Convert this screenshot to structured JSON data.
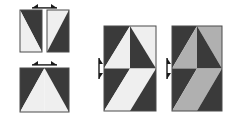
{
  "figure": {
    "background_color": "#ffffff",
    "width": 226,
    "height": 118,
    "palette": {
      "dark": "#3a3a3a",
      "light": "#efefef",
      "gray": "#b0b0b0",
      "outline": "#4a4a4a",
      "arrow": "#1a1a1a"
    },
    "groups": [
      {
        "name": "top-left-pair",
        "label": "Two diagonally split rectangles",
        "arrow": "horizontal-double-arrow",
        "arrow_position": "above",
        "tiles": [
          {
            "name": "tile-diagonal-a",
            "pattern": "diagonal-split",
            "x": 20,
            "y": 10,
            "w": 22,
            "h": 42,
            "regions": [
              {
                "name": "upper-right-triangle",
                "color": "dark"
              },
              {
                "name": "lower-left-triangle",
                "color": "light"
              }
            ]
          },
          {
            "name": "tile-diagonal-b",
            "pattern": "diagonal-split",
            "x": 47,
            "y": 10,
            "w": 22,
            "h": 42,
            "regions": [
              {
                "name": "upper-left-triangle",
                "color": "light"
              },
              {
                "name": "lower-right-triangle",
                "color": "dark"
              }
            ]
          }
        ]
      },
      {
        "name": "bottom-left-square",
        "label": "Four triangle mountain square",
        "arrow": "horizontal-double-arrow",
        "arrow_position": "above",
        "tiles": [
          {
            "name": "tile-mountain",
            "pattern": "four-triangle",
            "x": 20,
            "y": 68,
            "w": 49,
            "h": 44,
            "regions": [
              {
                "name": "left-outer-triangle",
                "color": "dark"
              },
              {
                "name": "left-inner-triangle",
                "color": "light"
              },
              {
                "name": "right-inner-triangle",
                "color": "light"
              },
              {
                "name": "right-outer-triangle",
                "color": "dark"
              }
            ]
          }
        ]
      },
      {
        "name": "center-pinwheel",
        "label": "Eight triangle pinwheel, light variant",
        "arrow": "vertical-double-arrow",
        "arrow_position": "left",
        "tiles": [
          {
            "name": "tile-pinwheel-light",
            "pattern": "eight-triangle-pinwheel",
            "x": 104,
            "y": 26,
            "w": 52,
            "h": 85,
            "variant": "light",
            "regions": [
              {
                "name": "q1-outer",
                "color": "dark"
              },
              {
                "name": "q1-inner",
                "color": "light"
              },
              {
                "name": "q2-outer",
                "color": "light"
              },
              {
                "name": "q2-inner",
                "color": "dark"
              },
              {
                "name": "q3-outer",
                "color": "dark"
              },
              {
                "name": "q3-inner",
                "color": "light"
              },
              {
                "name": "q4-outer",
                "color": "light"
              },
              {
                "name": "q4-inner",
                "color": "dark"
              }
            ]
          }
        ]
      },
      {
        "name": "right-pinwheel",
        "label": "Eight triangle pinwheel, gray variant",
        "arrow": "vertical-double-arrow",
        "arrow_position": "left",
        "tiles": [
          {
            "name": "tile-pinwheel-gray",
            "pattern": "eight-triangle-pinwheel",
            "x": 172,
            "y": 26,
            "w": 50,
            "h": 85,
            "variant": "gray",
            "regions": [
              {
                "name": "q1-outer",
                "color": "dark"
              },
              {
                "name": "q1-inner",
                "color": "gray"
              },
              {
                "name": "q2-outer",
                "color": "gray"
              },
              {
                "name": "q2-inner",
                "color": "dark"
              },
              {
                "name": "q3-outer",
                "color": "dark"
              },
              {
                "name": "q3-inner",
                "color": "gray"
              },
              {
                "name": "q4-outer",
                "color": "gray"
              },
              {
                "name": "q4-inner",
                "color": "dark"
              }
            ]
          }
        ]
      }
    ]
  }
}
